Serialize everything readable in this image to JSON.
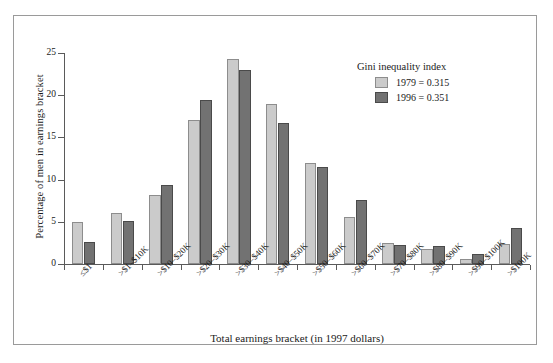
{
  "chart_data": {
    "type": "bar",
    "title": "",
    "xlabel": "Total earnings bracket (in 1997 dollars)",
    "ylabel": "Percentage of men in earnings bracket",
    "ylim": [
      0,
      25
    ],
    "yticks": [
      0,
      5,
      10,
      15,
      20,
      25
    ],
    "grid": false,
    "legend_position": "top-right",
    "legend_title": "Gini inequality index",
    "categories": [
      "≤$1",
      ">$1–$10K",
      ">$10–$20K",
      ">$20–$30K",
      ">$30–$40K",
      ">$40–$50K",
      ">$50–$60K",
      ">$60–$70K",
      ">$70–$80K",
      ">$80–$90K",
      ">$90–$100K",
      ">$100K"
    ],
    "series": [
      {
        "name": "1979 = 0.315",
        "year": "1979",
        "gini": "0.315",
        "color": "#cbcbcb",
        "values": [
          5.0,
          6.1,
          8.2,
          17.1,
          24.3,
          18.9,
          12.0,
          5.6,
          2.5,
          1.8,
          0.6,
          2.4
        ]
      },
      {
        "name": "1996 = 0.351",
        "year": "1996",
        "gini": "0.351",
        "color": "#727272",
        "values": [
          2.6,
          5.1,
          9.4,
          19.4,
          23.0,
          16.7,
          11.5,
          7.6,
          2.2,
          2.1,
          1.2,
          4.3
        ]
      }
    ]
  }
}
